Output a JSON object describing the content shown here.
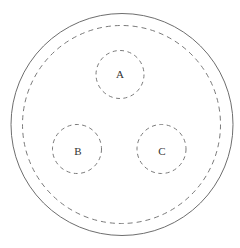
{
  "diagram": {
    "title": "",
    "outer_boundary": {
      "style": "solid",
      "color": "#6e6e6e",
      "cx": 122,
      "cy": 124.5,
      "r": 111
    },
    "inner_boundary": {
      "style": "dashed",
      "color": "#7a7a7a",
      "cx": 121.5,
      "cy": 124.5,
      "r": 99
    },
    "nodes": [
      {
        "id": "A",
        "label": "A",
        "cx": 120,
        "cy": 74.5,
        "r": 24,
        "style": "dashed"
      },
      {
        "id": "B",
        "label": "B",
        "cx": 77,
        "cy": 149,
        "r": 24.5,
        "style": "dashed"
      },
      {
        "id": "C",
        "label": "C",
        "cx": 161.5,
        "cy": 149,
        "r": 24.5,
        "style": "dashed"
      }
    ]
  }
}
